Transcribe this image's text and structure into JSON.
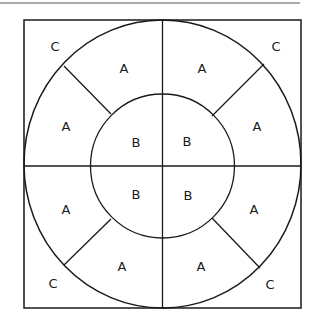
{
  "diagram": {
    "colors": {
      "stroke": "#1a1a1a",
      "top_rule": "#555555",
      "background": "#ffffff"
    },
    "labels": {
      "corner_tl": "C",
      "corner_tr": "C",
      "corner_bl": "C",
      "corner_br": "C",
      "ring_tl_upper": "A",
      "ring_tl_lower": "A",
      "ring_tr_upper": "A",
      "ring_tr_lower": "A",
      "ring_bl_upper": "A",
      "ring_bl_lower": "A",
      "ring_br_upper": "A",
      "ring_br_lower": "A",
      "inner_tl": "B",
      "inner_tr": "B",
      "inner_bl": "B",
      "inner_br": "B"
    }
  }
}
